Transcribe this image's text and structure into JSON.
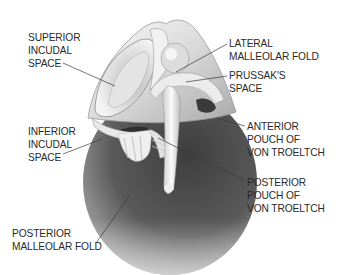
{
  "diagram": {
    "labels": [
      {
        "id": "superior-incudal-space",
        "text": "SUPERIOR\nINCUDAL\nSPACE",
        "x": 28,
        "y": 32
      },
      {
        "id": "inferior-incudal-space",
        "text": "INFERIOR\nINCUDAL\nSPACE",
        "x": 28,
        "y": 126
      },
      {
        "id": "posterior-malleolar-fold",
        "text": "POSTERIOR\nMALLEOLAR FOLD",
        "x": 12,
        "y": 228
      },
      {
        "id": "lateral-malleolar-fold",
        "text": "LATERAL\nMALLEOLAR FOLD",
        "x": 229,
        "y": 38
      },
      {
        "id": "prussaks-space",
        "text": "PRUSSAK'S\nSPACE",
        "x": 229,
        "y": 70
      },
      {
        "id": "anterior-pouch-of-von-troeltch",
        "text": "ANTERIOR\nPOUCH OF\nVON TROELTCH",
        "x": 247,
        "y": 121
      },
      {
        "id": "posterior-pouch-of-von-troeltch",
        "text": "POSTERIOR\nPOUCH OF\nVON TROELTCH",
        "x": 247,
        "y": 177
      }
    ],
    "leader_lines": [
      {
        "for": "superior-incudal-space",
        "x1": 63,
        "y1": 63,
        "x2": 115,
        "y2": 86
      },
      {
        "for": "inferior-incudal-space",
        "x1": 63,
        "y1": 154,
        "x2": 102,
        "y2": 139
      },
      {
        "for": "posterior-malleolar-fold",
        "x1": 96,
        "y1": 243,
        "x2": 130,
        "y2": 195
      },
      {
        "for": "lateral-malleolar-fold",
        "x1": 227,
        "y1": 44,
        "x2": 176,
        "y2": 72
      },
      {
        "for": "prussaks-space",
        "x1": 227,
        "y1": 76,
        "x2": 186,
        "y2": 82
      },
      {
        "for": "anterior-pouch-of-von-troeltch",
        "x1": 245,
        "y1": 126,
        "x2": 216,
        "y2": 118
      },
      {
        "for": "posterior-pouch-of-von-troeltch",
        "x1": 245,
        "y1": 181,
        "x2": 158,
        "y2": 138
      }
    ]
  }
}
